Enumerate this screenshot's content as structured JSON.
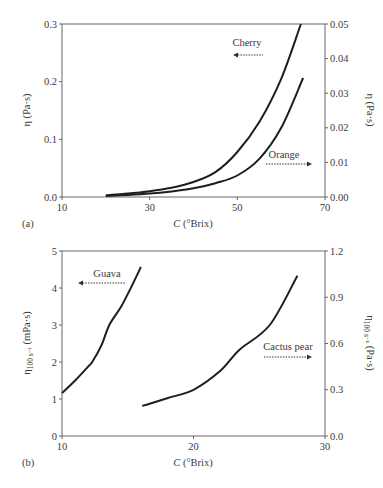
{
  "chart_data": [
    {
      "type": "line",
      "panel_label": "(a)",
      "xlabel_italic": "C",
      "xlabel_rest": " (°Brix)",
      "ylabel_left": "η (Pa·s)",
      "ylabel_right": "η (Pa·s)",
      "xlim": [
        10,
        70
      ],
      "ylim_left": [
        0,
        0.3
      ],
      "ylim_right": [
        0,
        0.05
      ],
      "xticks": [
        "10",
        "30",
        "50",
        "70"
      ],
      "xtick_values": [
        10,
        30,
        50,
        70
      ],
      "yticks_left": [
        "0.0",
        "0.1",
        "0.2",
        "0.3"
      ],
      "ytick_values_left": [
        0,
        0.1,
        0.2,
        0.3
      ],
      "yticks_right": [
        "0.00",
        "0.01",
        "0.02",
        "0.03",
        "0.04",
        "0.05"
      ],
      "ytick_values_right": [
        0,
        0.01,
        0.02,
        0.03,
        0.04,
        0.05
      ],
      "grid": false,
      "series": [
        {
          "name": "Cherry",
          "axis": "left",
          "arrow": "left",
          "x": [
            20,
            25,
            30,
            35,
            40,
            45,
            50,
            55,
            60,
            64.5
          ],
          "y": [
            0.003,
            0.006,
            0.01,
            0.016,
            0.026,
            0.043,
            0.078,
            0.13,
            0.205,
            0.3
          ]
        },
        {
          "name": "Orange",
          "axis": "right",
          "arrow": "right",
          "x": [
            20,
            25,
            30,
            35,
            40,
            45,
            50,
            55,
            60,
            65
          ],
          "y": [
            0.0003,
            0.0006,
            0.001,
            0.0016,
            0.0025,
            0.004,
            0.0062,
            0.011,
            0.02,
            0.0344
          ]
        }
      ]
    },
    {
      "type": "line",
      "panel_label": "(b)",
      "xlabel_italic": "C",
      "xlabel_rest": " (°Brix)",
      "ylabel_left": "η100 s⁻¹ (mPa·s)",
      "ylabel_right": "η100 s⁻¹ (Pa·s)",
      "xlim": [
        10,
        30
      ],
      "ylim_left": [
        0,
        5
      ],
      "ylim_right": [
        0,
        1.2
      ],
      "xticks": [
        "10",
        "20",
        "30"
      ],
      "xtick_values": [
        10,
        20,
        30
      ],
      "yticks_left": [
        "0",
        "1",
        "2",
        "3",
        "4",
        "5"
      ],
      "ytick_values_left": [
        0,
        1,
        2,
        3,
        4,
        5
      ],
      "yticks_right": [
        "0.0",
        "0.3",
        "0.6",
        "0.9",
        "1.2"
      ],
      "ytick_values_right": [
        0,
        0.3,
        0.6,
        0.9,
        1.2
      ],
      "grid": false,
      "series": [
        {
          "name": "Guava",
          "axis": "left",
          "arrow": "left",
          "x": [
            10,
            11,
            12,
            12.3,
            13,
            13.6,
            14.5,
            15.3,
            16.0
          ],
          "y": [
            1.16,
            1.5,
            1.88,
            2.0,
            2.45,
            3.0,
            3.5,
            4.05,
            4.57
          ]
        },
        {
          "name": "Cactus pear",
          "axis": "right",
          "arrow": "right",
          "x": [
            16.1,
            18,
            20,
            22,
            23.5,
            25.8,
            27.9
          ],
          "y": [
            0.195,
            0.245,
            0.3,
            0.42,
            0.56,
            0.72,
            1.04
          ]
        }
      ]
    }
  ],
  "panels": {
    "a": {
      "label": "(a)",
      "x_title_italic": "C",
      "x_title_rest": " (°Brix)",
      "y_left_title": "η (Pa·s)",
      "y_right_title": "η (Pa·s)",
      "series_labels": {
        "cherry": "Cherry",
        "orange": "Orange"
      }
    },
    "b": {
      "label": "(b)",
      "x_title_italic": "C",
      "x_title_rest": " (°Brix)",
      "y_left_title_main": "η",
      "y_left_title_sub": "100 s⁻¹",
      "y_left_title_unit": " (mPa·s)",
      "y_right_title_main": "η",
      "y_right_title_sub": "100 s⁻¹",
      "y_right_title_unit": " (Pa·s)",
      "series_labels": {
        "guava": "Guava",
        "cactus": "Cactus pear"
      }
    }
  },
  "colors": {
    "line": "#1e1e1e",
    "axis": "#555555",
    "text": "#3a3a3a"
  }
}
